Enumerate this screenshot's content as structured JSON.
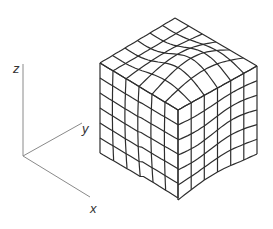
{
  "figure": {
    "type": "3d-deformed-mesh-cube",
    "axes": {
      "z_label": "z",
      "y_label": "y",
      "x_label": "x"
    },
    "mesh": {
      "divisions": 6,
      "line_color": "#2e2e2e",
      "axis_color": "#8a8a8a"
    }
  }
}
